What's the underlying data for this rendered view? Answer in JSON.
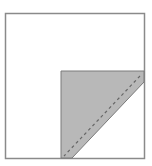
{
  "diagram": {
    "type": "quilt-block-folding-illustration",
    "outer_square": {
      "x": 5,
      "y": 13,
      "width": 139,
      "height": 145,
      "stroke": "#8a8a8a",
      "fill": "#ffffff"
    },
    "shaded_piece": {
      "points": "61,71 144,71 144,82 72,158 61,158",
      "fill": "#b8b8b8",
      "stroke": "#7a7a7a"
    },
    "seam_line": {
      "x1": 140,
      "y1": 76,
      "x2": 64,
      "y2": 156,
      "stroke": "#666666",
      "dash": "3,3"
    },
    "colors": {
      "background": "#ffffff",
      "border": "#8a8a8a",
      "shade": "#b8b8b8",
      "seam": "#666666"
    }
  }
}
